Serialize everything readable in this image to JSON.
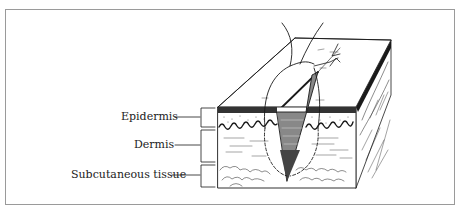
{
  "figure": {
    "labels": [
      {
        "id": "epidermis",
        "text": "Epidermis"
      },
      {
        "id": "dermis",
        "text": "Dermis"
      },
      {
        "id": "subcutaneous",
        "text": "Subcutaneous tissue"
      }
    ]
  },
  "colors": {
    "ink": "#1a1a1a",
    "frame": "#9a9a9a",
    "background": "#ffffff"
  }
}
